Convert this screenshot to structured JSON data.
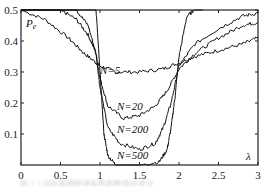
{
  "chart_data": {
    "type": "line",
    "title": "",
    "xlabel": "λ",
    "ylabel": "P_e",
    "xlim": [
      0,
      3
    ],
    "ylim": [
      0,
      0.5
    ],
    "x_ticks": [
      "0",
      "0.5",
      "1",
      "1.5",
      "2",
      "2.5",
      "3"
    ],
    "y_ticks": [
      "0.1",
      "0.2",
      "0.3",
      "0.4",
      "0.5"
    ],
    "grid": false,
    "legend": "inline labels",
    "series": [
      {
        "name": "N=5",
        "label": "N=5",
        "x": [
          0,
          0.3,
          0.6,
          0.8,
          0.95,
          1.0,
          1.2,
          1.5,
          1.8,
          2.0,
          2.2,
          2.5,
          2.8,
          3.0
        ],
        "y": [
          0.5,
          0.47,
          0.41,
          0.36,
          0.33,
          0.32,
          0.3,
          0.3,
          0.31,
          0.33,
          0.35,
          0.37,
          0.39,
          0.41
        ]
      },
      {
        "name": "N=20",
        "label": "N=20",
        "x": [
          0,
          0.5,
          0.7,
          0.85,
          0.95,
          1.0,
          1.1,
          1.3,
          1.5,
          1.7,
          1.85,
          2.0,
          2.2,
          2.5,
          2.8,
          3.0
        ],
        "y": [
          0.5,
          0.5,
          0.47,
          0.42,
          0.36,
          0.28,
          0.19,
          0.15,
          0.16,
          0.19,
          0.24,
          0.31,
          0.36,
          0.41,
          0.45,
          0.46
        ]
      },
      {
        "name": "N=200",
        "label": "N=200",
        "x": [
          0,
          0.7,
          0.85,
          0.95,
          1.0,
          1.1,
          1.25,
          1.5,
          1.7,
          1.8,
          1.9,
          2.0,
          2.2,
          2.5,
          2.8,
          3.0
        ],
        "y": [
          0.5,
          0.5,
          0.45,
          0.36,
          0.25,
          0.12,
          0.07,
          0.05,
          0.07,
          0.12,
          0.2,
          0.32,
          0.39,
          0.44,
          0.48,
          0.49
        ]
      },
      {
        "name": "N=500",
        "label": "N=500",
        "x": [
          0,
          0.95,
          1.0,
          1.05,
          1.1,
          1.2,
          1.5,
          1.75,
          1.85,
          1.9,
          1.95,
          2.0,
          2.1,
          2.2,
          2.3
        ],
        "y": [
          0.5,
          0.5,
          0.3,
          0.1,
          0.03,
          0.0,
          0.0,
          0.01,
          0.05,
          0.12,
          0.22,
          0.35,
          0.48,
          0.5,
          0.5
        ]
      }
    ]
  },
  "labels": {
    "y_axis": "P",
    "y_axis_sub": "e",
    "x_axis": "λ",
    "n5": "N=5",
    "n20": "N=20",
    "n200": "N=200",
    "n500": "N=500"
  },
  "caption": "图 2.3 误码率随粗调系数和数值的变化"
}
